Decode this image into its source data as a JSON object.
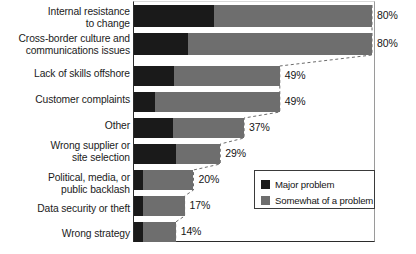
{
  "chart_data": {
    "type": "bar",
    "orientation": "horizontal",
    "stacked": true,
    "title": "",
    "xlabel": "",
    "ylabel": "",
    "xlim": [
      0,
      81
    ],
    "grid": false,
    "legend_position": "inside-right",
    "categories": [
      "Internal resistance\nto change",
      "Cross-border culture and\ncommunications issues",
      "Lack of skills offshore",
      "Customer complaints",
      "Other",
      "Wrong supplier or\nsite selection",
      "Political, media, or\npublic backlash",
      "Data security or theft",
      "Wrong strategy"
    ],
    "series": [
      {
        "name": "Major problem",
        "color": "#1a1a1a",
        "values": [
          27,
          18,
          13.5,
          7,
          13,
          14,
          3,
          3,
          3
        ]
      },
      {
        "name": "Somewhat of a problem",
        "color": "#6e6e6e",
        "values": [
          53,
          62,
          35.5,
          42,
          24,
          15,
          17,
          14,
          11
        ]
      }
    ],
    "totals": [
      80,
      80,
      49,
      49,
      37,
      29,
      20,
      17,
      14
    ],
    "value_labels": [
      "80%",
      "80%",
      "49%",
      "49%",
      "37%",
      "29%",
      "20%",
      "17%",
      "14%"
    ]
  },
  "legend": {
    "items": [
      {
        "label": "Major problem",
        "swatch": "major-problem-swatch"
      },
      {
        "label": "Somewhat of a problem",
        "swatch": "somewhat-problem-swatch"
      }
    ]
  },
  "colors": {
    "major": "#1a1a1a",
    "somewhat": "#6e6e6e",
    "axis": "#2b2b2b",
    "background": "#ffffff",
    "connector": "#6b6b6b"
  }
}
